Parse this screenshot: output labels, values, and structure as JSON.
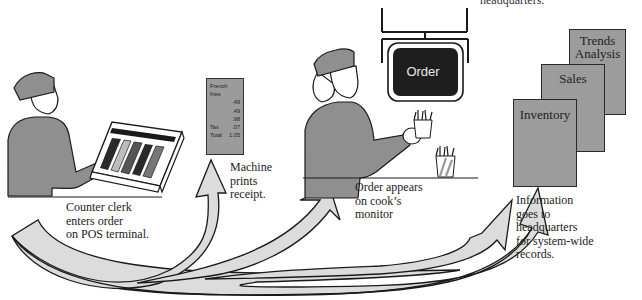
{
  "diagram": {
    "title_fragment": "headquarters.",
    "steps": [
      {
        "id": "step-1",
        "caption_lines": [
          "Counter clerk",
          "enters order",
          "on POS terminal."
        ]
      },
      {
        "id": "step-2",
        "caption_lines": [
          "Machine",
          "prints",
          "receipt."
        ]
      },
      {
        "id": "step-3",
        "caption_lines": [
          "Order appears",
          "on cook’s",
          "monitor"
        ]
      },
      {
        "id": "step-4",
        "caption_lines": [
          "Information",
          "goes to",
          "headquarters",
          "for system-wide",
          "records."
        ]
      }
    ],
    "receipt": {
      "item_line1": "French",
      "item_line2": "fries",
      "lines": [
        {
          "label": "",
          "amount": ".49"
        },
        {
          "label": "",
          "amount": ".49"
        },
        {
          "label": "",
          "amount": ".98"
        },
        {
          "label": "Tax",
          "amount": ".07"
        },
        {
          "label": "Total",
          "amount": "1.05"
        }
      ]
    },
    "monitor": {
      "label": "Order"
    },
    "reports": [
      {
        "label_line1": "Trends",
        "label_line2": "Analysis"
      },
      {
        "label_line1": "Sales",
        "label_line2": ""
      },
      {
        "label_line1": "Inventory",
        "label_line2": ""
      }
    ],
    "colors": {
      "arrow_fill": "#dcdcdc",
      "figure_fill": "#8f8f8f",
      "report_fill": "#9c9c9c",
      "monitor_screen": "#1e1e1e",
      "outline": "#1a1a1a"
    }
  }
}
